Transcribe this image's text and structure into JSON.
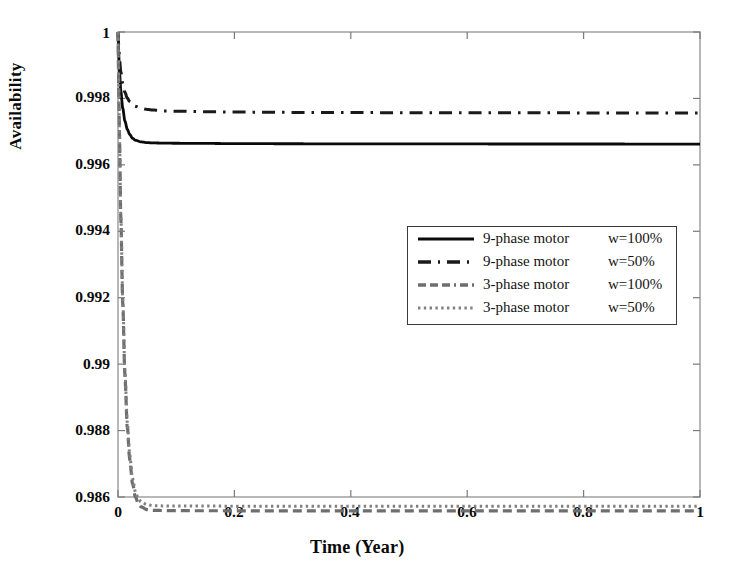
{
  "chart_data": {
    "type": "line",
    "title": "",
    "xlabel": "Time (Year)",
    "ylabel": "Availability",
    "xlim": [
      0,
      1
    ],
    "ylim": [
      0.986,
      1
    ],
    "xticks": [
      "0",
      "0.2",
      "0.4",
      "0.6",
      "0.8",
      "1"
    ],
    "xtick_values": [
      0,
      0.2,
      0.4,
      0.6,
      0.8,
      1
    ],
    "yticks": [
      "0.986",
      "0.988",
      "0.99",
      "0.992",
      "0.994",
      "0.996",
      "0.998",
      "1"
    ],
    "ytick_values": [
      0.986,
      0.988,
      0.99,
      0.992,
      0.994,
      0.996,
      0.998,
      1
    ],
    "grid": false,
    "legend_position": "center-right",
    "series": [
      {
        "name": "9-phase motor   w=100%",
        "label_name": "9-phase motor",
        "label_w": "w=100%",
        "style": "solid",
        "color": "#0a0a0a",
        "start_value": 1.0,
        "steady_value": 0.99663,
        "x": [
          0,
          0.002,
          0.005,
          0.008,
          0.012,
          0.016,
          0.02,
          0.025,
          0.03,
          0.04,
          0.05,
          0.06,
          0.08,
          0.1,
          0.15,
          0.2,
          0.3,
          0.4,
          0.5,
          0.6,
          0.7,
          0.8,
          0.9,
          1.0
        ],
        "y": [
          1.0,
          0.99898,
          0.9982,
          0.99772,
          0.99731,
          0.99707,
          0.99692,
          0.9968,
          0.99674,
          0.99669,
          0.99667,
          0.99666,
          0.996655,
          0.99665,
          0.996645,
          0.99664,
          0.996635,
          0.996632,
          0.99663,
          0.996629,
          0.996628,
          0.996628,
          0.996627,
          0.996627
        ]
      },
      {
        "name": "9-phase motor   w=50%",
        "label_name": "9-phase motor",
        "label_w": "w=50%",
        "style": "dashdot",
        "color": "#1a1a1a",
        "start_value": 1.0,
        "steady_value": 0.99756,
        "x": [
          0,
          0.002,
          0.005,
          0.008,
          0.012,
          0.016,
          0.02,
          0.025,
          0.03,
          0.04,
          0.05,
          0.06,
          0.08,
          0.1,
          0.15,
          0.2,
          0.3,
          0.4,
          0.5,
          0.6,
          0.7,
          0.8,
          0.9,
          1.0
        ],
        "y": [
          1.0,
          0.9993,
          0.99878,
          0.99845,
          0.99818,
          0.99801,
          0.99791,
          0.99781,
          0.99776,
          0.9977,
          0.99767,
          0.99765,
          0.997625,
          0.997615,
          0.9976,
          0.99759,
          0.99758,
          0.997575,
          0.99757,
          0.997568,
          0.997566,
          0.997565,
          0.997564,
          0.997563
        ]
      },
      {
        "name": "3-phase motor   w=100%",
        "label_name": "3-phase motor",
        "label_w": "w=100%",
        "style": "dashed",
        "color": "#6e6e6e",
        "start_value": 1.0,
        "steady_value": 0.98736,
        "x": [
          0,
          0.002,
          0.005,
          0.008,
          0.012,
          0.016,
          0.02,
          0.025,
          0.03,
          0.035,
          0.04,
          0.05,
          0.06,
          0.07,
          0.08,
          0.1,
          0.15,
          0.2,
          0.3,
          0.4,
          0.5,
          0.6,
          0.7,
          0.8,
          0.9,
          1.0
        ],
        "y": [
          1.0,
          0.9974,
          0.9943,
          0.9919,
          0.9896,
          0.9881,
          0.98715,
          0.9864,
          0.986,
          0.9858,
          0.9857,
          0.98562,
          0.9856,
          0.985595,
          0.98559,
          0.985588,
          0.985586,
          0.985585,
          0.985584,
          0.985583,
          0.985583,
          0.985582,
          0.985582,
          0.985582,
          0.985581,
          0.985581
        ]
      },
      {
        "name": "3-phase motor   w=50%",
        "label_name": "3-phase motor",
        "label_w": "w=50%",
        "style": "dotted",
        "color": "#808080",
        "start_value": 1.0,
        "steady_value": 0.98736,
        "x": [
          0,
          0.002,
          0.005,
          0.008,
          0.012,
          0.016,
          0.02,
          0.025,
          0.03,
          0.035,
          0.04,
          0.05,
          0.06,
          0.07,
          0.08,
          0.1,
          0.15,
          0.2,
          0.3,
          0.4,
          0.5,
          0.6,
          0.7,
          0.8,
          0.9,
          1.0
        ],
        "y": [
          1.0,
          0.99745,
          0.9944,
          0.99205,
          0.98975,
          0.98825,
          0.9873,
          0.98655,
          0.98615,
          0.98595,
          0.98585,
          0.98577,
          0.98574,
          0.985735,
          0.98573,
          0.985728,
          0.985726,
          0.985725,
          0.985724,
          0.985723,
          0.985723,
          0.985722,
          0.985722,
          0.985722,
          0.985721,
          0.985721
        ]
      }
    ]
  },
  "axes": {
    "frame_color": "#9a9a9a",
    "tick_color": "#7a7a7a"
  }
}
